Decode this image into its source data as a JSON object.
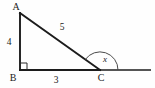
{
  "figure": {
    "type": "right-triangle-with-exterior-angle",
    "background_color": "#fefefe",
    "stroke_color": "#1c1c1c",
    "vertices": [
      {
        "name": "A",
        "label": "A",
        "x": 20,
        "y": 13,
        "label_x": 16,
        "label_y": 10
      },
      {
        "name": "B",
        "label": "B",
        "x": 20,
        "y": 70,
        "label_x": 13,
        "label_y": 81
      },
      {
        "name": "C",
        "label": "C",
        "x": 100,
        "y": 70,
        "label_x": 101,
        "label_y": 81
      }
    ],
    "sides": [
      {
        "name": "AB",
        "label": "4",
        "label_x": 9,
        "label_y": 45
      },
      {
        "name": "BC",
        "label": "3",
        "label_x": 56,
        "label_y": 83
      },
      {
        "name": "AC",
        "label": "5",
        "label_x": 62,
        "label_y": 30
      }
    ],
    "angles": [
      {
        "name": "B",
        "label": "",
        "marker": "right-angle-square",
        "size": 7
      },
      {
        "name": "C-exterior",
        "label": "x",
        "marker": "arc",
        "radius": 18,
        "label_x": 105,
        "label_y": 62
      }
    ],
    "ray": {
      "name": "BC-extended",
      "from_x": 100,
      "from_y": 70,
      "to_x": 151,
      "to_y": 70
    }
  }
}
